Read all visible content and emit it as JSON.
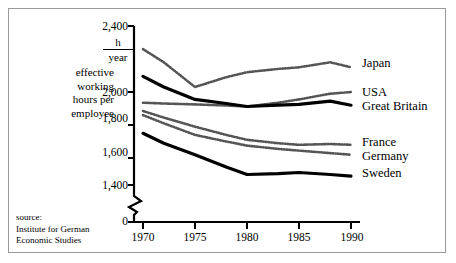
{
  "axis": {
    "y_label": "effective\nworking\nhours per\nemployee",
    "unit_numerator": "h",
    "unit_denominator": "year",
    "y_ticks": [
      "2,400",
      "2,000",
      "1,800",
      "1,600",
      "1,400",
      "0"
    ],
    "x_ticks": [
      "1970",
      "1975",
      "1980",
      "1985",
      "1990"
    ]
  },
  "source": "source:\nInstitute for German\nEconomic Studies",
  "series_labels": {
    "japan": "Japan",
    "usa": "USA",
    "great_britain": "Great Britain",
    "france": "France",
    "germany": "Germany",
    "sweden": "Sweden"
  },
  "colors": {
    "line_solid": "#000000",
    "line_dotted": "#555555",
    "frame": "#9a9a9a",
    "background": "#ffffff"
  },
  "chart_data": {
    "type": "line",
    "title": "",
    "xlabel": "",
    "ylabel": "effective working hours per employee",
    "unit": "h/year",
    "xlim": [
      1970,
      1990
    ],
    "ylim": [
      1300,
      2400
    ],
    "y_axis_break": true,
    "y_axis_break_between": [
      0,
      1300
    ],
    "grid": false,
    "legend_position": "right-line-end",
    "x": [
      1970,
      1972,
      1975,
      1978,
      1980,
      1983,
      1985,
      1988,
      1990
    ],
    "series": [
      {
        "name": "Japan",
        "style": "dotted",
        "values": [
          2260,
          2180,
          2030,
          2090,
          2120,
          2140,
          2150,
          2180,
          2150
        ]
      },
      {
        "name": "USA",
        "style": "dotted",
        "values": [
          1935,
          1930,
          1925,
          1918,
          1912,
          1935,
          1955,
          1990,
          2000
        ]
      },
      {
        "name": "Great Britain",
        "style": "solid-thick",
        "values": [
          2095,
          2030,
          1955,
          1930,
          1912,
          1920,
          1925,
          1945,
          1920
        ]
      },
      {
        "name": "France",
        "style": "dotted",
        "values": [
          1885,
          1845,
          1790,
          1740,
          1710,
          1690,
          1680,
          1685,
          1680
        ]
      },
      {
        "name": "Germany",
        "style": "dotted",
        "values": [
          1860,
          1810,
          1740,
          1700,
          1675,
          1655,
          1645,
          1630,
          1620
        ]
      },
      {
        "name": "Sweden",
        "style": "solid-thick",
        "values": [
          1750,
          1690,
          1620,
          1545,
          1500,
          1505,
          1512,
          1500,
          1490
        ]
      }
    ]
  }
}
